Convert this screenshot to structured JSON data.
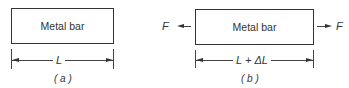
{
  "figure_a": {
    "box_label": "Metal bar",
    "dimension_label": "L",
    "caption": "( a )"
  },
  "figure_b": {
    "box_label": "Metal bar",
    "dimension_label": "L + ΔL",
    "caption": "( b )",
    "force_left": "F",
    "force_right": "F"
  }
}
